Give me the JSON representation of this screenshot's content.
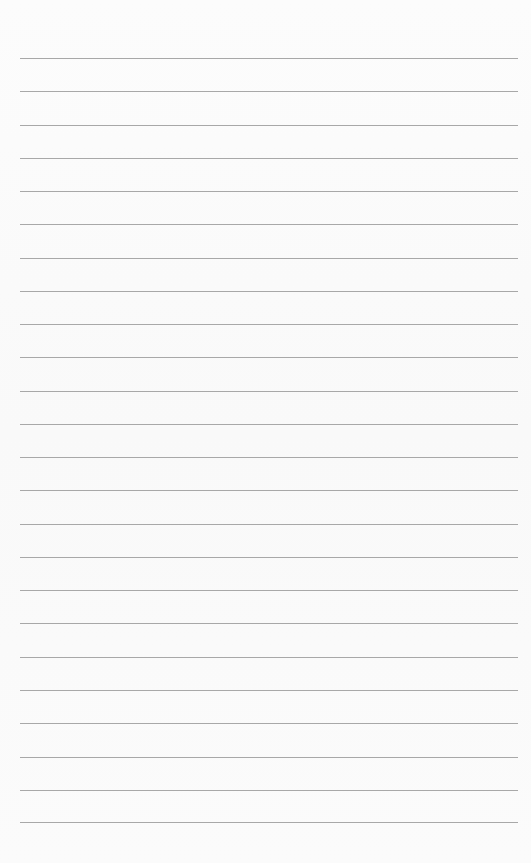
{
  "paper": {
    "background": "#fbfbfb",
    "line_color": "#a8a8a8",
    "line_left": 20,
    "line_width": 498,
    "lines_y": [
      58,
      91,
      125,
      158,
      191,
      224,
      258,
      291,
      324,
      357,
      391,
      424,
      457,
      490,
      524,
      557,
      590,
      623,
      657,
      690,
      723,
      757,
      790,
      822
    ]
  }
}
